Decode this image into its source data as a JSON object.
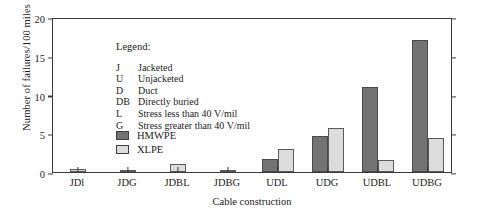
{
  "chart_data": {
    "type": "bar",
    "title": "",
    "xlabel": "Cable construction",
    "ylabel": "Number of failures/100 miles",
    "ylim": [
      0,
      20
    ],
    "yticks": [
      0,
      5,
      10,
      15,
      20
    ],
    "grid": false,
    "legend_position": "inside-top-left",
    "categories": [
      "JDl",
      "JDG",
      "JDBL",
      "JDBG",
      "UDL",
      "UDG",
      "UDBL",
      "UDBG"
    ],
    "series": [
      {
        "name": "HMWPE",
        "color": "#737373",
        "values": [
          0,
          0,
          0,
          0,
          1.7,
          4.6,
          11.0,
          17.0
        ]
      },
      {
        "name": "XLPE",
        "color": "#dcdcdc",
        "values": [
          0.35,
          0.3,
          1.0,
          0.3,
          3.0,
          5.7,
          1.5,
          4.4
        ]
      }
    ]
  },
  "legend": {
    "title": "Legend:",
    "entries": [
      {
        "key": "J",
        "desc": "Jacketed"
      },
      {
        "key": "U",
        "desc": "Unjacketed"
      },
      {
        "key": "D",
        "desc": "Duct"
      },
      {
        "key": "DB",
        "desc": "Directly buried"
      },
      {
        "key": "L",
        "desc": "Stress less than 40 V/mil"
      },
      {
        "key": "G",
        "desc": "Stress greater than 40 V/mil"
      }
    ]
  }
}
